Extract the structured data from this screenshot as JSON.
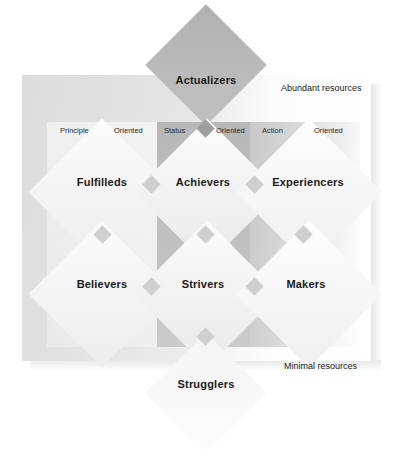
{
  "diagram": {
    "resource_axis": {
      "top_label": "Abundant resources",
      "bottom_label": "Minimal resources"
    },
    "orientations": [
      {
        "name": "Principle",
        "qualifier": "Oriented"
      },
      {
        "name": "Status",
        "qualifier": "Oriented"
      },
      {
        "name": "Action",
        "qualifier": "Oriented"
      }
    ],
    "apex": {
      "label": "Actualizers"
    },
    "base": {
      "label": "Strugglers"
    },
    "segments": [
      {
        "label": "Fulfilleds",
        "column": "Principle",
        "row": "upper"
      },
      {
        "label": "Achievers",
        "column": "Status",
        "row": "upper"
      },
      {
        "label": "Experiencers",
        "column": "Action",
        "row": "upper"
      },
      {
        "label": "Believers",
        "column": "Principle",
        "row": "lower"
      },
      {
        "label": "Strivers",
        "column": "Status",
        "row": "lower"
      },
      {
        "label": "Makers",
        "column": "Action",
        "row": "lower"
      }
    ],
    "colors": {
      "panel_light": "#dcdcdc",
      "status_column": "#bcbcbc",
      "action_column": "#c9c9c9",
      "apex_fill": "#b8b8b8",
      "base_fill": "#f8f8f8",
      "segment_fill": "#f4f4f4",
      "node_fill": "#cfcfcf",
      "text": "#1a1a1a"
    }
  }
}
